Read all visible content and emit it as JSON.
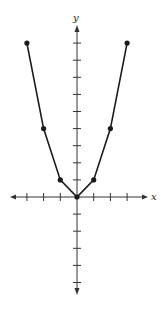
{
  "chart_data": {
    "type": "line",
    "title": "",
    "xlabel": "x",
    "ylabel": "y",
    "x": [
      -3,
      -2,
      -1,
      0,
      1,
      2,
      3
    ],
    "series": [
      {
        "name": "y = x^2",
        "values": [
          9,
          4,
          1,
          0,
          1,
          4,
          9
        ]
      }
    ],
    "xlim": [
      -4,
      4
    ],
    "ylim": [
      -7,
      10
    ],
    "x_ticks": [
      -3,
      -2,
      -1,
      1,
      2,
      3
    ],
    "y_ticks": [
      -5,
      -4,
      -3,
      -2,
      -1,
      1,
      2,
      3,
      4,
      5,
      6,
      7,
      8,
      9
    ],
    "grid": false,
    "legend": false,
    "markers": true
  },
  "axes": {
    "x_label": "x",
    "y_label": "y"
  },
  "colors": {
    "line": "#1a1a1a",
    "axis": "#333333"
  }
}
